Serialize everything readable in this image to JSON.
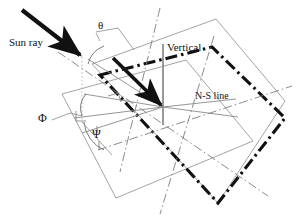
{
  "figure": {
    "kind": "solar-geometry-diagram",
    "width": 299,
    "height": 224,
    "background": "#ffffff"
  },
  "labels": {
    "sun_ray": "Sun ray",
    "vertical": "Vertical",
    "ns_line": "N-S line",
    "theta": "θ",
    "phi": "Φ",
    "psi": "Ψ"
  },
  "colors": {
    "bold_black": "#111111",
    "thin_gray": "#8a8a8a",
    "light_gray": "#9a9a9a",
    "vertical_gray": "#8f8f8f",
    "background": "#ffffff"
  },
  "geometry": {
    "center_vertex": {
      "x": 163,
      "y": 107
    },
    "horizontal_plane_polygon": "62,94 186,60 253,141 116,198",
    "tilted_plane_polygon": "92,64 216,19 285,101 218,203",
    "sun_ray": {
      "x1": 22,
      "y1": 10,
      "x2": 82,
      "y2": 57
    },
    "normal_arrow": {
      "x1": 113,
      "y1": 58,
      "x2": 163,
      "y2": 107
    },
    "vertical_line": {
      "x1": 163,
      "y1": 44,
      "x2": 163,
      "y2": 125
    },
    "ns_line": {
      "x1": 103,
      "y1": 115,
      "x2": 236,
      "y2": 99
    }
  }
}
